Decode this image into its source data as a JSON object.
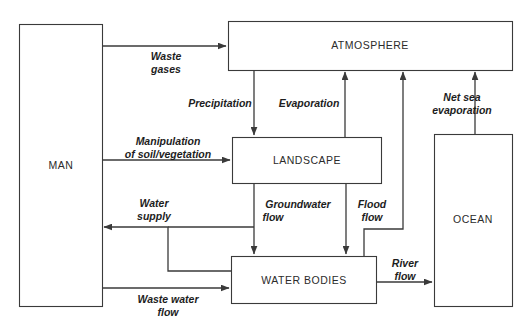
{
  "diagram": {
    "colors": {
      "stroke": "#3a3a3a",
      "node_fill": "#ffffff",
      "label_text": "#2b2b2b",
      "flow_text": "#1d1d1d",
      "background": "#ffffff"
    },
    "nodes": [
      {
        "id": "man",
        "label": "MAN"
      },
      {
        "id": "atmosphere",
        "label": "ATMOSPHERE"
      },
      {
        "id": "landscape",
        "label": "LANDSCAPE"
      },
      {
        "id": "water_bodies",
        "label": "WATER BODIES"
      },
      {
        "id": "ocean",
        "label": "OCEAN"
      }
    ],
    "flows": [
      {
        "id": "waste_gases",
        "line1": "Waste",
        "line2": "gases",
        "from": "man",
        "to": "atmosphere"
      },
      {
        "id": "precipitation",
        "line1": "Precipitation",
        "line2": "",
        "from": "atmosphere",
        "to": "landscape"
      },
      {
        "id": "evaporation",
        "line1": "Evaporation",
        "line2": "",
        "from": "landscape",
        "to": "atmosphere"
      },
      {
        "id": "net_sea_evaporation",
        "line1": "Net sea",
        "line2": "evaporation",
        "from": "ocean",
        "to": "atmosphere"
      },
      {
        "id": "manipulation",
        "line1": "Manipulation",
        "line2": "of soil/vegetation",
        "from": "man",
        "to": "landscape"
      },
      {
        "id": "water_supply",
        "line1": "Water",
        "line2": "supply",
        "from": "water_bodies",
        "to": "man"
      },
      {
        "id": "groundwater_flow",
        "line1": "Groundwater",
        "line2": "flow",
        "from": "landscape",
        "to": "water_bodies"
      },
      {
        "id": "flood_flow",
        "line1": "Flood",
        "line2": "flow",
        "from": "landscape",
        "to": "water_bodies"
      },
      {
        "id": "river_flow",
        "line1": "River",
        "line2": "flow",
        "from": "water_bodies",
        "to": "ocean"
      },
      {
        "id": "waste_water_flow",
        "line1": "Waste water",
        "line2": "flow",
        "from": "man",
        "to": "water_bodies"
      },
      {
        "id": "water_body_evap",
        "line1": "",
        "line2": "",
        "from": "water_bodies",
        "to": "atmosphere"
      }
    ]
  }
}
